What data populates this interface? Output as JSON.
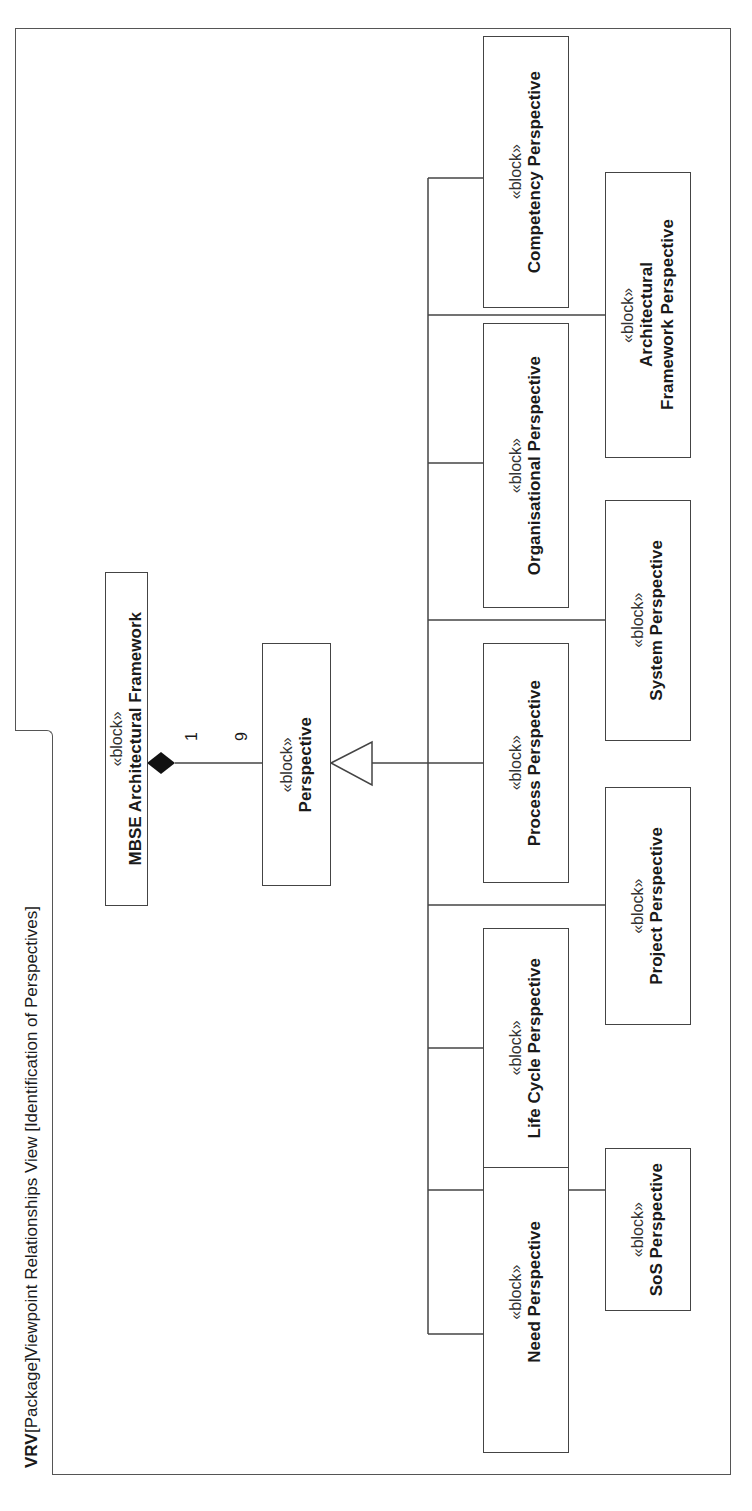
{
  "frame": {
    "kind": "VRV",
    "type": "[Package]",
    "title": "Viewpoint Relationships View [Identification of Perspectives]"
  },
  "stereotype": "«block»",
  "blocks": {
    "mbse": {
      "name": "MBSE Architectural Framework"
    },
    "perspective": {
      "name": "Perspective"
    },
    "need": {
      "name": "Need Perspective"
    },
    "sos": {
      "name": "SoS Perspective"
    },
    "life_cycle": {
      "name": "Life Cycle Perspective"
    },
    "project": {
      "name": "Project Perspective"
    },
    "process": {
      "name": "Process Perspective"
    },
    "system": {
      "name": "System Perspective"
    },
    "organisational": {
      "name": "Organisational Perspective"
    },
    "arch_framework": {
      "name": "Architectural Framework Perspective"
    },
    "competency": {
      "name": "Competency Perspective"
    }
  },
  "composition": {
    "whole_multiplicity": "1",
    "part_multiplicity": "9"
  },
  "colors": {
    "line": "#444444",
    "background": "#ffffff"
  }
}
